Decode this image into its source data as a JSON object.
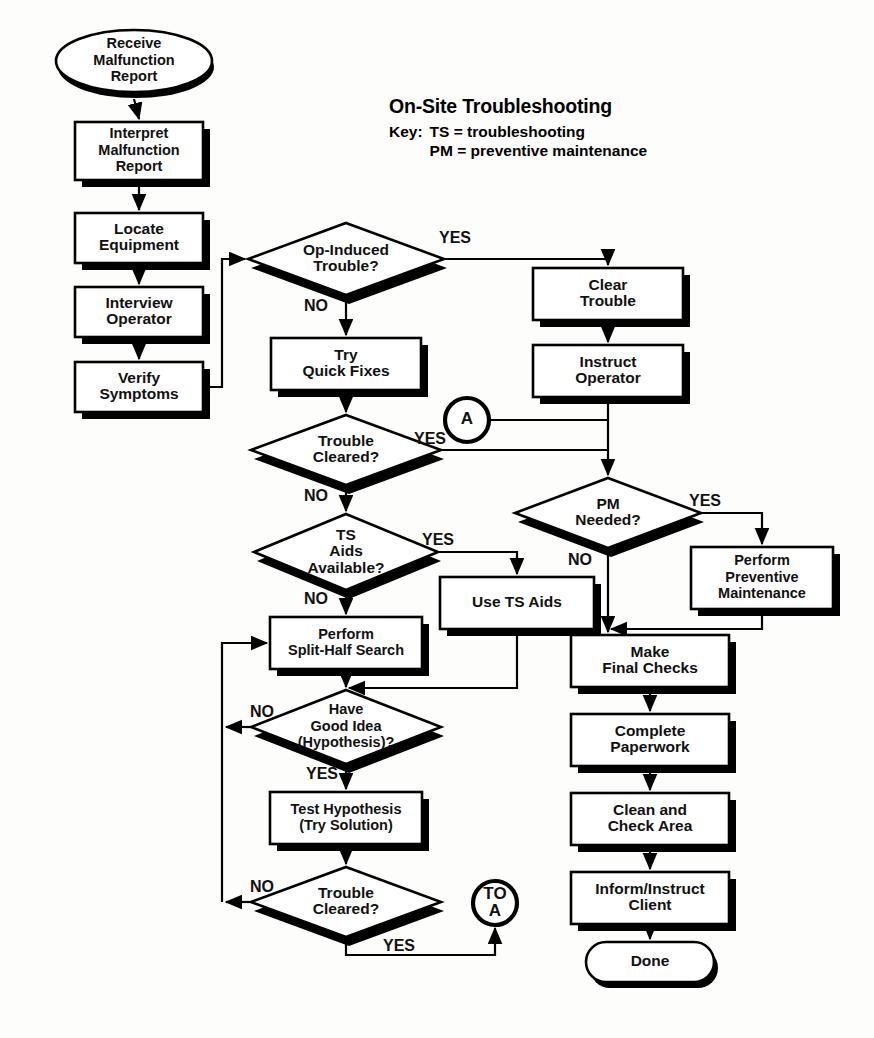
{
  "page": {
    "background": "#fdfdfb",
    "ink": "#000000",
    "width": 874,
    "height": 1038
  },
  "title": {
    "heading": "On-Site Troubleshooting",
    "key_label": "Key:",
    "key_lines": [
      "TS = troubleshooting",
      "PM = preventive maintenance"
    ]
  },
  "chart_data": {
    "type": "diagram",
    "diagram_kind": "flowchart",
    "title": "On-Site Troubleshooting",
    "nodes": [
      {
        "id": "start",
        "shape": "ellipse",
        "lines": [
          "Receive",
          "Malfunction",
          "Report"
        ],
        "cx": 134,
        "cy": 61,
        "w": 156,
        "h": 62
      },
      {
        "id": "interpret",
        "shape": "process",
        "lines": [
          "Interpret",
          "Malfunction",
          "Report"
        ],
        "cx": 139,
        "cy": 151,
        "w": 128,
        "h": 58
      },
      {
        "id": "locate",
        "shape": "process",
        "lines": [
          "Locate",
          "Equipment"
        ],
        "cx": 139,
        "cy": 238,
        "w": 128,
        "h": 50
      },
      {
        "id": "interview",
        "shape": "process",
        "lines": [
          "Interview",
          "Operator"
        ],
        "cx": 139,
        "cy": 312,
        "w": 128,
        "h": 50
      },
      {
        "id": "verify",
        "shape": "process",
        "lines": [
          "Verify",
          "Symptoms"
        ],
        "cx": 139,
        "cy": 387,
        "w": 128,
        "h": 50
      },
      {
        "id": "opinduced",
        "shape": "decision",
        "lines": [
          "Op-Induced",
          "Trouble?"
        ],
        "cx": 346,
        "cy": 259,
        "w": 196,
        "h": 72
      },
      {
        "id": "quickfixes",
        "shape": "process",
        "lines": [
          "Try",
          "Quick Fixes"
        ],
        "cx": 346,
        "cy": 364,
        "w": 150,
        "h": 52
      },
      {
        "id": "cleared1",
        "shape": "decision",
        "lines": [
          "Trouble",
          "Cleared?"
        ],
        "cx": 346,
        "cy": 450,
        "w": 190,
        "h": 70
      },
      {
        "id": "tsaidsq",
        "shape": "decision",
        "lines": [
          "TS",
          "Aids",
          "Available?"
        ],
        "cx": 346,
        "cy": 552,
        "w": 184,
        "h": 76
      },
      {
        "id": "splithalf",
        "shape": "process",
        "lines": [
          "Perform",
          "Split-Half Search"
        ],
        "cx": 346,
        "cy": 643,
        "w": 152,
        "h": 52
      },
      {
        "id": "usetsaids",
        "shape": "process",
        "lines": [
          "Use TS Aids"
        ],
        "cx": 517,
        "cy": 603,
        "w": 154,
        "h": 52
      },
      {
        "id": "goodidea",
        "shape": "decision",
        "lines": [
          "Have",
          "Good Idea",
          "(Hypothesis)?"
        ],
        "cx": 346,
        "cy": 727,
        "w": 190,
        "h": 74
      },
      {
        "id": "testhyp",
        "shape": "process",
        "lines": [
          "Test Hypothesis",
          "(Try Solution)"
        ],
        "cx": 346,
        "cy": 818,
        "w": 152,
        "h": 52
      },
      {
        "id": "cleared2",
        "shape": "decision",
        "lines": [
          "Trouble",
          "Cleared?"
        ],
        "cx": 346,
        "cy": 902,
        "w": 190,
        "h": 70
      },
      {
        "id": "cleartrb",
        "shape": "process",
        "lines": [
          "Clear",
          "Trouble"
        ],
        "cx": 608,
        "cy": 294,
        "w": 150,
        "h": 52
      },
      {
        "id": "instructop",
        "shape": "process",
        "lines": [
          "Instruct",
          "Operator"
        ],
        "cx": 608,
        "cy": 371,
        "w": 150,
        "h": 52
      },
      {
        "id": "pmneeded",
        "shape": "decision",
        "lines": [
          "PM",
          "Needed?"
        ],
        "cx": 608,
        "cy": 513,
        "w": 186,
        "h": 70
      },
      {
        "id": "performpm",
        "shape": "process",
        "lines": [
          "Perform",
          "Preventive",
          "Maintenance"
        ],
        "cx": 762,
        "cy": 578,
        "w": 142,
        "h": 62
      },
      {
        "id": "finalchecks",
        "shape": "process",
        "lines": [
          "Make",
          "Final Checks"
        ],
        "cx": 650,
        "cy": 661,
        "w": 158,
        "h": 52
      },
      {
        "id": "paperwork",
        "shape": "process",
        "lines": [
          "Complete",
          "Paperwork"
        ],
        "cx": 650,
        "cy": 740,
        "w": 158,
        "h": 52
      },
      {
        "id": "cleanarea",
        "shape": "process",
        "lines": [
          "Clean and",
          "Check Area"
        ],
        "cx": 650,
        "cy": 819,
        "w": 158,
        "h": 52
      },
      {
        "id": "informclient",
        "shape": "process",
        "lines": [
          "Inform/Instruct",
          "Client"
        ],
        "cx": 650,
        "cy": 898,
        "w": 158,
        "h": 52
      },
      {
        "id": "done",
        "shape": "terminator",
        "lines": [
          "Done"
        ],
        "cx": 650,
        "cy": 962,
        "w": 128,
        "h": 40
      },
      {
        "id": "connA",
        "shape": "connector",
        "lines": [
          "A"
        ],
        "cx": 467,
        "cy": 420,
        "w": 44,
        "h": 44
      },
      {
        "id": "connTOA",
        "shape": "connector",
        "lines": [
          "TO",
          "A"
        ],
        "cx": 495,
        "cy": 903,
        "w": 44,
        "h": 44
      }
    ],
    "edge_labels": [
      {
        "text": "YES",
        "x": 455,
        "y": 239
      },
      {
        "text": "NO",
        "x": 316,
        "y": 307
      },
      {
        "text": "YES",
        "x": 430,
        "y": 440
      },
      {
        "text": "NO",
        "x": 316,
        "y": 497
      },
      {
        "text": "YES",
        "x": 438,
        "y": 541
      },
      {
        "text": "NO",
        "x": 316,
        "y": 600
      },
      {
        "text": "NO",
        "x": 262,
        "y": 713
      },
      {
        "text": "YES",
        "x": 322,
        "y": 775
      },
      {
        "text": "NO",
        "x": 262,
        "y": 888
      },
      {
        "text": "YES",
        "x": 399,
        "y": 947
      },
      {
        "text": "YES",
        "x": 705,
        "y": 502
      },
      {
        "text": "NO",
        "x": 580,
        "y": 561
      }
    ],
    "edges": [
      {
        "from": "start",
        "to": "interpret",
        "label": ""
      },
      {
        "from": "interpret",
        "to": "locate",
        "label": ""
      },
      {
        "from": "locate",
        "to": "interview",
        "label": ""
      },
      {
        "from": "interview",
        "to": "verify",
        "label": ""
      },
      {
        "from": "verify",
        "to": "opinduced",
        "label": ""
      },
      {
        "from": "opinduced",
        "to": "cleartrb",
        "label": "YES"
      },
      {
        "from": "opinduced",
        "to": "quickfixes",
        "label": "NO"
      },
      {
        "from": "cleartrb",
        "to": "instructop",
        "label": ""
      },
      {
        "from": "instructop",
        "to": "pmneeded",
        "label": ""
      },
      {
        "from": "quickfixes",
        "to": "cleared1",
        "label": ""
      },
      {
        "from": "cleared1",
        "to": "pmneeded",
        "label": "YES"
      },
      {
        "from": "cleared1",
        "to": "tsaidsq",
        "label": "NO"
      },
      {
        "from": "connA",
        "to": "pmneeded",
        "label": ""
      },
      {
        "from": "tsaidsq",
        "to": "usetsaids",
        "label": "YES"
      },
      {
        "from": "tsaidsq",
        "to": "splithalf",
        "label": "NO"
      },
      {
        "from": "usetsaids",
        "to": "goodidea",
        "label": ""
      },
      {
        "from": "splithalf",
        "to": "goodidea",
        "label": ""
      },
      {
        "from": "goodidea",
        "to": "splithalf",
        "label": "NO"
      },
      {
        "from": "goodidea",
        "to": "testhyp",
        "label": "YES"
      },
      {
        "from": "testhyp",
        "to": "cleared2",
        "label": ""
      },
      {
        "from": "cleared2",
        "to": "splithalf",
        "label": "NO"
      },
      {
        "from": "cleared2",
        "to": "connTOA",
        "label": "YES"
      },
      {
        "from": "pmneeded",
        "to": "performpm",
        "label": "YES"
      },
      {
        "from": "pmneeded",
        "to": "finalchecks",
        "label": "NO"
      },
      {
        "from": "performpm",
        "to": "finalchecks",
        "label": ""
      },
      {
        "from": "finalchecks",
        "to": "paperwork",
        "label": ""
      },
      {
        "from": "paperwork",
        "to": "cleanarea",
        "label": ""
      },
      {
        "from": "cleanarea",
        "to": "informclient",
        "label": ""
      },
      {
        "from": "informclient",
        "to": "done",
        "label": ""
      }
    ]
  }
}
